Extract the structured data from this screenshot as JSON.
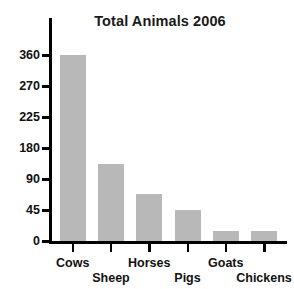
{
  "chart_data": {
    "type": "bar",
    "title": "Total Animals 2006",
    "xlabel": "",
    "ylabel": "",
    "categories": [
      "Cows",
      "Sheep",
      "Horses",
      "Pigs",
      "Goats",
      "Chickens"
    ],
    "values": [
      360,
      135,
      68,
      45,
      15,
      15
    ],
    "series": [
      {
        "name": "Total Animals 2006",
        "values": [
          360,
          135,
          68,
          45,
          15,
          15
        ]
      }
    ],
    "y_tick_labels": [
      "360",
      "270",
      "225",
      "180",
      "90",
      "45",
      "0"
    ],
    "y_tick_values": [
      360,
      270,
      225,
      180,
      90,
      45,
      0
    ],
    "ylim": [
      0,
      360
    ],
    "grid": false,
    "legend": false,
    "legend_position": "none",
    "axis_note": "y-axis ticks are evenly spaced on screen but have unequal value gaps",
    "bar_color": "#b8b8b8",
    "axis_color": "#000000",
    "background_color": "#ffffff",
    "text_color": "#111111"
  },
  "labels": {
    "y_ticks": [
      {
        "text": "360"
      },
      {
        "text": "270"
      },
      {
        "text": "225"
      },
      {
        "text": "180"
      },
      {
        "text": "90"
      },
      {
        "text": "45"
      },
      {
        "text": "0"
      }
    ],
    "categories": [
      {
        "text": "Cows"
      },
      {
        "text": "Sheep"
      },
      {
        "text": "Horses"
      },
      {
        "text": "Pigs"
      },
      {
        "text": "Goats"
      },
      {
        "text": "Chickens"
      }
    ]
  }
}
